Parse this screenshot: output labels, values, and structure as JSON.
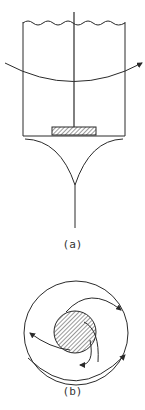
{
  "figure": {
    "panel_a": {
      "label": "(a)"
    },
    "panel_b": {
      "label": "(b)"
    }
  },
  "colors": {
    "stroke": "#2a2a2a",
    "background": "#ffffff"
  }
}
